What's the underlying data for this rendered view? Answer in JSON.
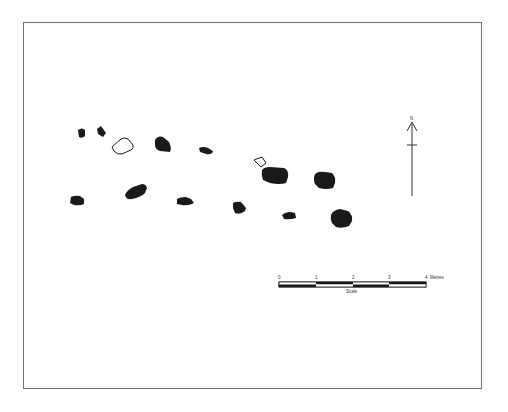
{
  "figure": {
    "type": "archaeological site plan",
    "frame_color": "#6e6e6e",
    "feature_color": "#1a1a1a"
  },
  "north_arrow": {
    "label": "N"
  },
  "scale_bar": {
    "ticks": [
      "0",
      "1",
      "2",
      "3",
      "4"
    ],
    "unit": "Metres",
    "caption": "Scale"
  },
  "features": [
    {
      "id": "f1",
      "style": "filled",
      "cx": 81,
      "cy": 133
    },
    {
      "id": "f2",
      "style": "filled",
      "cx": 101,
      "cy": 131
    },
    {
      "id": "f3",
      "style": "outline",
      "cx": 123,
      "cy": 146
    },
    {
      "id": "f4",
      "style": "filled",
      "cx": 163,
      "cy": 145
    },
    {
      "id": "f5",
      "style": "filled",
      "cx": 206,
      "cy": 150
    },
    {
      "id": "f6",
      "style": "outline",
      "cx": 259,
      "cy": 162
    },
    {
      "id": "f7",
      "style": "filled",
      "cx": 274,
      "cy": 176
    },
    {
      "id": "f8",
      "style": "filled",
      "cx": 325,
      "cy": 180
    },
    {
      "id": "f9",
      "style": "filled",
      "cx": 77,
      "cy": 201
    },
    {
      "id": "f10",
      "style": "filled",
      "cx": 136,
      "cy": 192
    },
    {
      "id": "f11",
      "style": "filled",
      "cx": 185,
      "cy": 201
    },
    {
      "id": "f12",
      "style": "filled",
      "cx": 240,
      "cy": 208
    },
    {
      "id": "f13",
      "style": "filled",
      "cx": 289,
      "cy": 216
    },
    {
      "id": "f14",
      "style": "filled",
      "cx": 342,
      "cy": 219
    }
  ]
}
